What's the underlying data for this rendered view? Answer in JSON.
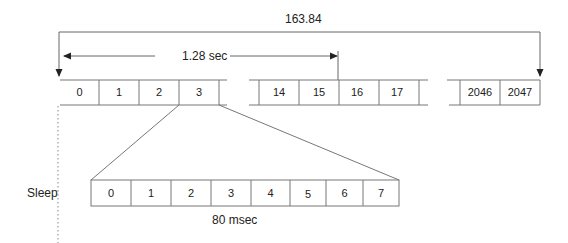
{
  "labels": {
    "total_period": "163.84",
    "frame_period": "1.28 sec",
    "slot_period": "80 msec",
    "sleep": "Sleep"
  },
  "top_row": {
    "segment_1": [
      "0",
      "1",
      "2",
      "3"
    ],
    "segment_2": [
      "14",
      "15",
      "16",
      "17"
    ],
    "segment_3": [
      "2046",
      "2047"
    ]
  },
  "bottom_row": {
    "cells": [
      "0",
      "1",
      "2",
      "3",
      "4",
      "5",
      "6",
      "7"
    ]
  },
  "colors": {
    "line": "#555555",
    "text": "#222222",
    "background": "#ffffff"
  }
}
